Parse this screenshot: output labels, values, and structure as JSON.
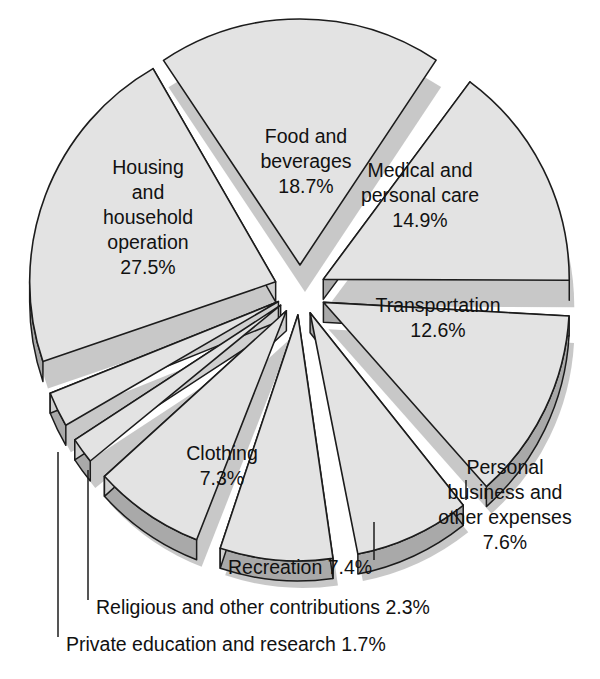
{
  "chart_data": {
    "type": "pie",
    "title": "",
    "title_visible": false,
    "exploded": true,
    "three_d": true,
    "units": "percent",
    "total": 100.0,
    "legend_position": "none",
    "grid": false,
    "categories": [
      "Food and beverages",
      "Medical and personal care",
      "Transportation",
      "Personal business and other expenses",
      "Recreation",
      "Clothing",
      "Private education and research",
      "Religious and other contributions",
      "Housing and household operation"
    ],
    "values": [
      18.7,
      14.9,
      12.6,
      7.6,
      7.4,
      7.3,
      1.7,
      2.3,
      27.5
    ],
    "slices": [
      {
        "id": "food-and-beverages",
        "label_lines": [
          "Food and",
          "beverages"
        ],
        "value_text": "18.7%",
        "value": 18.7,
        "label_placement": "inside",
        "start_deg": -33.7,
        "end_deg": 33.6,
        "explode": 26,
        "label_dx": 6,
        "label_dy": -128
      },
      {
        "id": "medical-and-personal-care",
        "label_lines": [
          "Medical and",
          "personal care"
        ],
        "value_text": "14.9%",
        "value": 14.9,
        "label_placement": "inside",
        "start_deg": 36.6,
        "end_deg": 90.2,
        "explode": 26,
        "label_dx": 120,
        "label_dy": -94
      },
      {
        "id": "transportation",
        "label_lines": [
          "Transportation"
        ],
        "value_text": "12.6%",
        "value": 12.6,
        "label_placement": "inside",
        "start_deg": 93.2,
        "end_deg": 138.5,
        "explode": 26,
        "label_dx": 138,
        "label_dy": 28
      },
      {
        "id": "personal-business-and-other-expenses",
        "label_lines": [
          "Personal",
          "business and",
          "other expenses"
        ],
        "value_text": "7.6%",
        "value": 7.6,
        "label_placement": "outside",
        "start_deg": 141.5,
        "end_deg": 168.8,
        "explode": 24,
        "leader_from_x": 466,
        "leader_from_y": 480,
        "leader_to_x": 466,
        "leader_to_y": 500,
        "label_x": 505,
        "label_y": 506,
        "label_anchor": "middle"
      },
      {
        "id": "recreation",
        "label_lines": [
          "Recreation 7.4%"
        ],
        "value_text": "7.4%",
        "value": 7.4,
        "label_placement": "outside",
        "start_deg": 171.8,
        "end_deg": 198.4,
        "explode": 24,
        "leader_from_x": 374,
        "leader_from_y": 522,
        "leader_to_x": 374,
        "leader_to_y": 560,
        "label_x": 228,
        "label_y": 569,
        "label_anchor": "start"
      },
      {
        "id": "clothing",
        "label_lines": [
          "Clothing"
        ],
        "value_text": "7.3%",
        "value": 7.3,
        "label_placement": "inside",
        "start_deg": 201.4,
        "end_deg": 227.7,
        "explode": 24,
        "label_dx": -78,
        "label_dy": 176
      },
      {
        "id": "private-education-and-research",
        "label_lines": [
          "Private education and research 1.7%"
        ],
        "value_text": "1.7%",
        "value": 1.7,
        "label_placement": "outside",
        "start_deg": 230.7,
        "end_deg": 236.8,
        "explode": 24,
        "leader_from_x": 58,
        "leader_from_y": 452,
        "leader_to_x": 58,
        "leader_to_y": 637,
        "label_x": 66,
        "label_y": 646,
        "label_anchor": "start"
      },
      {
        "id": "religious-and-other-contributions",
        "label_lines": [
          "Religious and other contributions 2.3%"
        ],
        "value_text": "2.3%",
        "value": 2.3,
        "label_placement": "outside",
        "start_deg": 239.8,
        "end_deg": 248.1,
        "explode": 24,
        "leader_from_x": 88,
        "leader_from_y": 470,
        "leader_to_x": 88,
        "leader_to_y": 600,
        "label_x": 96,
        "label_y": 609,
        "label_anchor": "start"
      },
      {
        "id": "housing-and-household-operation",
        "label_lines": [
          "Housing",
          "and",
          "household",
          "operation"
        ],
        "value_text": "27.5%",
        "value": 27.5,
        "label_placement": "inside",
        "start_deg": 251.1,
        "end_deg": 330.1,
        "explode": 26,
        "label_dx": -152,
        "label_dy": -72
      }
    ],
    "geometry": {
      "cx": 300,
      "cy": 291,
      "rx": 246,
      "ry": 246,
      "depth": 20
    },
    "colors": {
      "slice_top": "#e3e3e3",
      "slice_side": "#a9a9a9",
      "slice_side_light": "#d0d0d0",
      "outline": "#1c1c1c",
      "shadow": "#9a9a9a",
      "text": "#111111",
      "background": "#ffffff"
    }
  }
}
